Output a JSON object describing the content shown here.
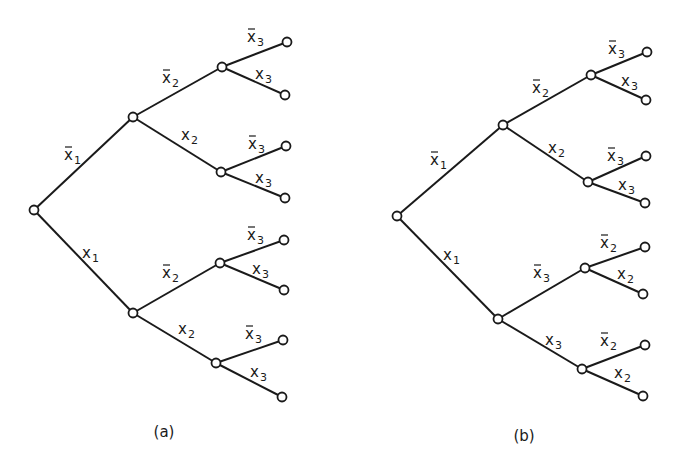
{
  "figure": {
    "trees": [
      {
        "id": "a",
        "caption": "(a)",
        "caption_pos": [
          164,
          437
        ],
        "nodes": {
          "root": [
            34,
            210
          ],
          "n1": [
            133,
            117
          ],
          "n2": [
            133,
            313
          ],
          "n11": [
            222,
            67
          ],
          "n12": [
            221,
            172
          ],
          "n21": [
            220,
            263
          ],
          "n22": [
            216,
            363
          ],
          "l111": [
            287,
            42
          ],
          "l112": [
            285,
            95
          ],
          "l121": [
            286,
            146
          ],
          "l122": [
            285,
            198
          ],
          "l211": [
            284,
            240
          ],
          "l212": [
            284,
            290
          ],
          "l221": [
            283,
            340
          ],
          "l222": [
            282,
            397
          ]
        },
        "edges": [
          {
            "from": "root",
            "to": "n1",
            "var": "x",
            "sub": "1",
            "neg": true,
            "lx": 64,
            "ly": 160
          },
          {
            "from": "root",
            "to": "n2",
            "var": "x",
            "sub": "1",
            "neg": false,
            "lx": 82,
            "ly": 258
          },
          {
            "from": "n1",
            "to": "n11",
            "var": "x",
            "sub": "2",
            "neg": true,
            "lx": 162,
            "ly": 83
          },
          {
            "from": "n1",
            "to": "n12",
            "var": "x",
            "sub": "2",
            "neg": false,
            "lx": 181,
            "ly": 140
          },
          {
            "from": "n2",
            "to": "n21",
            "var": "x",
            "sub": "2",
            "neg": true,
            "lx": 162,
            "ly": 278
          },
          {
            "from": "n2",
            "to": "n22",
            "var": "x",
            "sub": "2",
            "neg": false,
            "lx": 178,
            "ly": 334
          },
          {
            "from": "n11",
            "to": "l111",
            "var": "x",
            "sub": "3",
            "neg": true,
            "lx": 247,
            "ly": 42
          },
          {
            "from": "n11",
            "to": "l112",
            "var": "x",
            "sub": "3",
            "neg": false,
            "lx": 255,
            "ly": 79
          },
          {
            "from": "n12",
            "to": "l121",
            "var": "x",
            "sub": "3",
            "neg": true,
            "lx": 248,
            "ly": 149
          },
          {
            "from": "n12",
            "to": "l122",
            "var": "x",
            "sub": "3",
            "neg": false,
            "lx": 255,
            "ly": 183
          },
          {
            "from": "n21",
            "to": "l211",
            "var": "x",
            "sub": "3",
            "neg": true,
            "lx": 247,
            "ly": 240
          },
          {
            "from": "n21",
            "to": "l212",
            "var": "x",
            "sub": "3",
            "neg": false,
            "lx": 252,
            "ly": 274
          },
          {
            "from": "n22",
            "to": "l221",
            "var": "x",
            "sub": "3",
            "neg": true,
            "lx": 245,
            "ly": 339
          },
          {
            "from": "n22",
            "to": "l222",
            "var": "x",
            "sub": "3",
            "neg": false,
            "lx": 250,
            "ly": 377
          }
        ]
      },
      {
        "id": "b",
        "caption": "(b)",
        "caption_pos": [
          524,
          441
        ],
        "nodes": {
          "root": [
            397,
            216
          ],
          "n1": [
            503,
            125
          ],
          "n2": [
            498,
            319
          ],
          "n11": [
            591,
            75
          ],
          "n12": [
            588,
            182
          ],
          "n21": [
            585,
            268
          ],
          "n22": [
            582,
            369
          ],
          "l111": [
            647,
            52
          ],
          "l112": [
            646,
            100
          ],
          "l121": [
            646,
            156
          ],
          "l122": [
            645,
            203
          ],
          "l211": [
            645,
            247
          ],
          "l212": [
            643,
            294
          ],
          "l221": [
            645,
            345
          ],
          "l222": [
            643,
            396
          ]
        },
        "edges": [
          {
            "from": "root",
            "to": "n1",
            "var": "x",
            "sub": "1",
            "neg": true,
            "lx": 430,
            "ly": 165
          },
          {
            "from": "root",
            "to": "n2",
            "var": "x",
            "sub": "1",
            "neg": false,
            "lx": 443,
            "ly": 260
          },
          {
            "from": "n1",
            "to": "n11",
            "var": "x",
            "sub": "2",
            "neg": true,
            "lx": 532,
            "ly": 93
          },
          {
            "from": "n1",
            "to": "n12",
            "var": "x",
            "sub": "2",
            "neg": false,
            "lx": 548,
            "ly": 153
          },
          {
            "from": "n2",
            "to": "n21",
            "var": "x",
            "sub": "3",
            "neg": true,
            "lx": 533,
            "ly": 278
          },
          {
            "from": "n2",
            "to": "n22",
            "var": "x",
            "sub": "3",
            "neg": false,
            "lx": 545,
            "ly": 345
          },
          {
            "from": "n11",
            "to": "l111",
            "var": "x",
            "sub": "3",
            "neg": true,
            "lx": 608,
            "ly": 54
          },
          {
            "from": "n11",
            "to": "l112",
            "var": "x",
            "sub": "3",
            "neg": false,
            "lx": 621,
            "ly": 86
          },
          {
            "from": "n12",
            "to": "l121",
            "var": "x",
            "sub": "3",
            "neg": true,
            "lx": 607,
            "ly": 161
          },
          {
            "from": "n12",
            "to": "l122",
            "var": "x",
            "sub": "3",
            "neg": false,
            "lx": 618,
            "ly": 190
          },
          {
            "from": "n21",
            "to": "l211",
            "var": "x",
            "sub": "2",
            "neg": true,
            "lx": 600,
            "ly": 248
          },
          {
            "from": "n21",
            "to": "l212",
            "var": "x",
            "sub": "2",
            "neg": false,
            "lx": 617,
            "ly": 279
          },
          {
            "from": "n22",
            "to": "l221",
            "var": "x",
            "sub": "2",
            "neg": true,
            "lx": 600,
            "ly": 346
          },
          {
            "from": "n22",
            "to": "l222",
            "var": "x",
            "sub": "2",
            "neg": false,
            "lx": 614,
            "ly": 378
          }
        ]
      }
    ],
    "node_radius": 4.5,
    "colors": {
      "ink": "#1a1a1a",
      "paper": "#ffffff"
    }
  }
}
